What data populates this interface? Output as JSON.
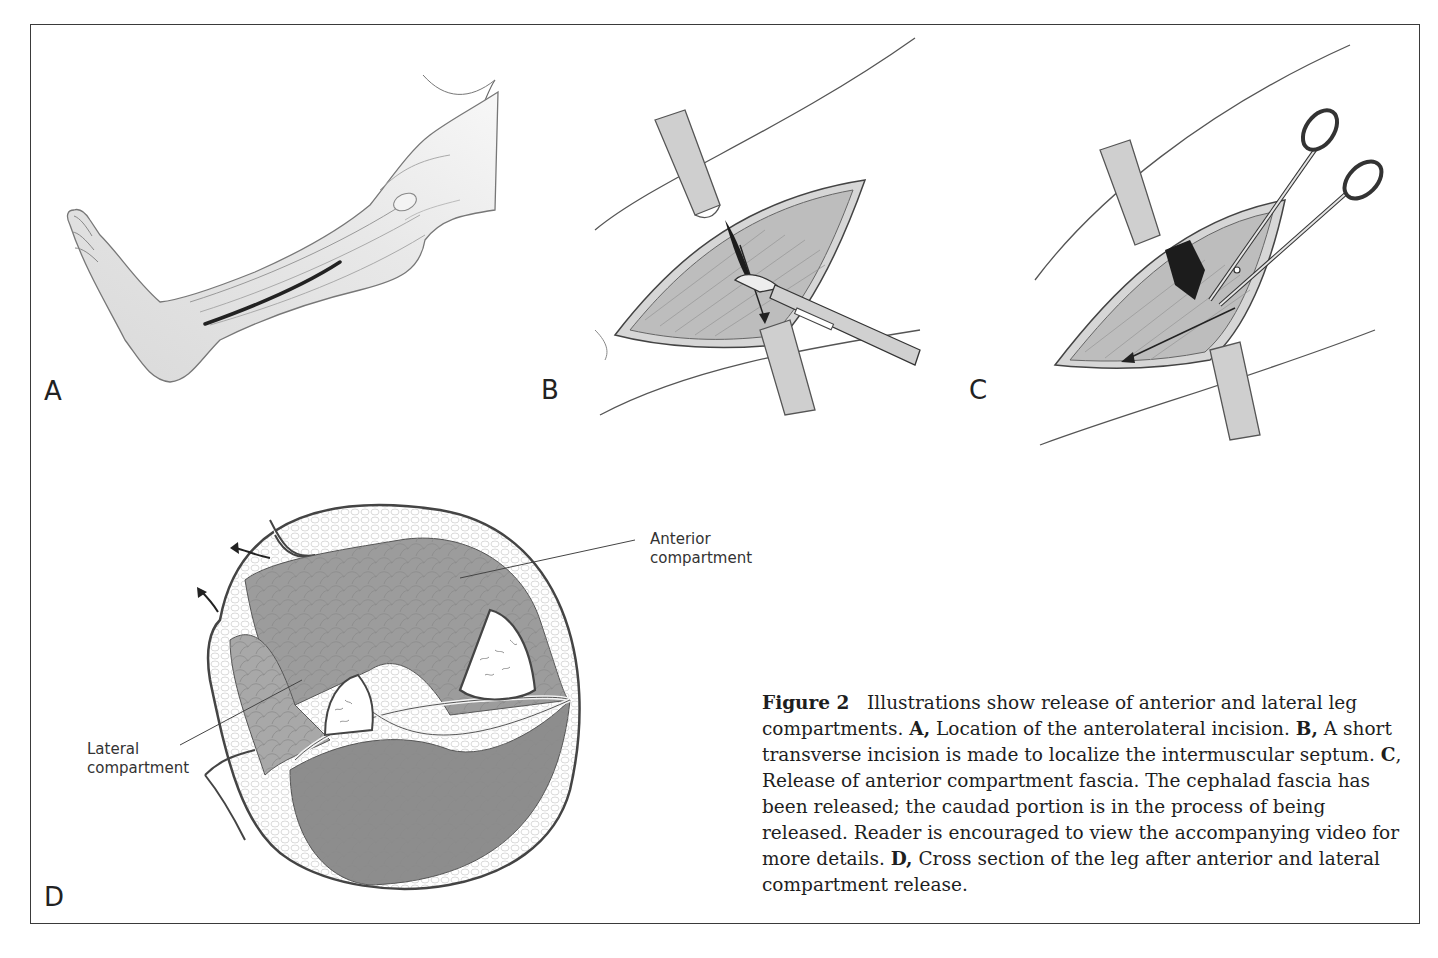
{
  "figure": {
    "number_label": "Figure 2",
    "caption_parts": {
      "intro": "Illustrations show release of anterior and lateral leg compartments.",
      "a_key": "A,",
      "a_text": "Location of the anterolateral incision.",
      "b_key": "B,",
      "b_text": "A short transverse incision is made to localize the intermuscular septum.",
      "c_key": "C",
      "c_text": ", Release of anterior compartment fascia. The cephalad fascia has been released; the caudad portion is in the process of being released. Reader is encouraged to view the accompanying video for more details.",
      "d_key": "D,",
      "d_text": "Cross section of the leg after anterior and lateral compartment release."
    },
    "panels": [
      {
        "letter": "A",
        "description": "Leg with anterolateral incision"
      },
      {
        "letter": "B",
        "description": "Short transverse incision with scalpel between retractors"
      },
      {
        "letter": "C",
        "description": "Fascia release with scissors between retractors"
      },
      {
        "letter": "D",
        "description": "Cross section of the leg after compartment release"
      }
    ],
    "labels": {
      "anterior_line1": "Anterior",
      "anterior_line2": "compartment",
      "lateral_line1": "Lateral",
      "lateral_line2": "compartment"
    }
  }
}
